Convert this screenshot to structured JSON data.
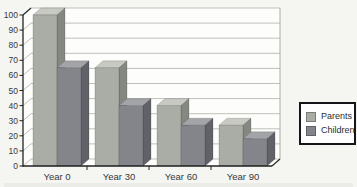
{
  "chart_data": {
    "type": "bar",
    "style": "3d-clustered",
    "title": "",
    "xlabel": "",
    "ylabel": "",
    "categories": [
      "Year 0",
      "Year 30",
      "Year 60",
      "Year 90"
    ],
    "series": [
      {
        "name": "Parents",
        "values": [
          100,
          65,
          40,
          27
        ],
        "colors": {
          "front": "#a9ada6",
          "top": "#c7c9c2",
          "side": "#858881"
        }
      },
      {
        "name": "Children",
        "values": [
          65,
          40,
          27,
          18
        ],
        "colors": {
          "front": "#83858b",
          "top": "#a2a4a8",
          "side": "#606268"
        }
      }
    ],
    "y_axis": {
      "min": 0,
      "max": 100,
      "tick_interval": 10,
      "tick_labels": [
        "100",
        "90",
        "80",
        "70",
        "60",
        "50",
        "40",
        "30",
        "20",
        "10",
        "0"
      ]
    },
    "x_axis": {
      "tick_labels": [
        "Year 0",
        "Year 30",
        "Year 60",
        "Year 90"
      ]
    },
    "grid": true,
    "legend": {
      "position": "right",
      "items": [
        "Parents",
        "Children"
      ]
    },
    "colors": {
      "wall_fill": "#fdfdfb",
      "gridline": "#bfbfbc",
      "axis": "#222222",
      "text": "#38383a",
      "page_background": "#f5f5f2",
      "legend_border": "#15151a",
      "legend_fill": "#ffffff"
    }
  }
}
